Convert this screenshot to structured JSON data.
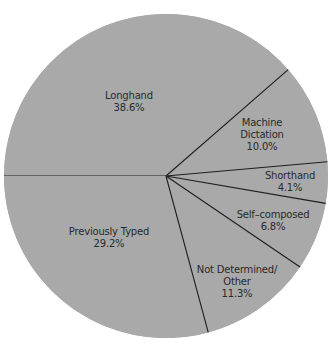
{
  "chart_data": {
    "type": "pie",
    "title": "",
    "start_angle_deg": 180,
    "direction": "clockwise",
    "fill_color": "#a9a9a9",
    "line_color": "#1e1e1e",
    "center": [
      166,
      176
    ],
    "radius": 162,
    "slices": [
      {
        "label": "Longhand",
        "label_lines": [
          "Longhand"
        ],
        "value": 38.6,
        "value_text": "38.6%",
        "label_pos": [
          129,
          90
        ]
      },
      {
        "label": "Machine Dictation",
        "label_lines": [
          "Machine",
          "Dictation"
        ],
        "value": 10.0,
        "value_text": "10.0%",
        "label_pos": [
          262,
          117
        ]
      },
      {
        "label": "Shorthand",
        "label_lines": [
          "Shorthand"
        ],
        "value": 4.1,
        "value_text": "4.1%",
        "label_pos": [
          290,
          170
        ]
      },
      {
        "label": "Self-composed",
        "label_lines": [
          "Self–composed"
        ],
        "value": 6.8,
        "value_text": "6.8%",
        "label_pos": [
          273,
          209
        ]
      },
      {
        "label": "Not Determined/Other",
        "label_lines": [
          "Not Determined/",
          "Other"
        ],
        "value": 11.3,
        "value_text": "11.3%",
        "label_pos": [
          237,
          264
        ]
      },
      {
        "label": "Previously Typed",
        "label_lines": [
          "Previously Typed"
        ],
        "value": 29.2,
        "value_text": "29.2%",
        "label_pos": [
          109,
          226
        ]
      }
    ]
  }
}
